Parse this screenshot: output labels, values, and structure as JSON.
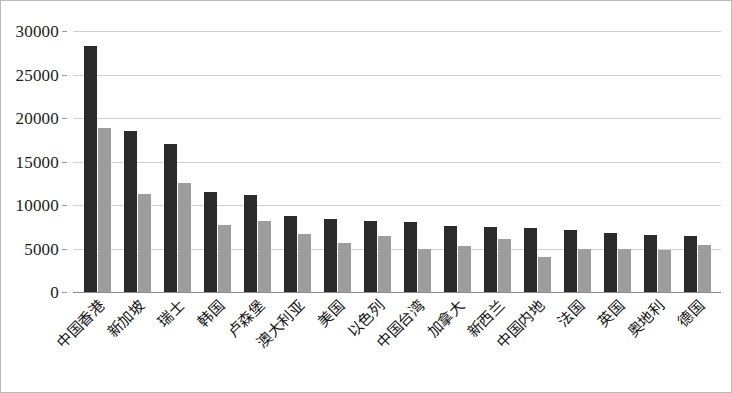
{
  "chart_data": {
    "type": "bar",
    "title": "",
    "subtitle": "",
    "xlabel": "",
    "ylabel": "",
    "ylim": [
      0,
      30000
    ],
    "ytick_interval": 5000,
    "yticks": [
      "0",
      "5000",
      "10000",
      "15000",
      "20000",
      "25000",
      "30000"
    ],
    "ytick_values": [
      0,
      5000,
      10000,
      15000,
      20000,
      25000,
      30000
    ],
    "grid": true,
    "legend": "none",
    "categories": [
      "中国香港",
      "新加坡",
      "瑞士",
      "韩国",
      "卢森堡",
      "澳大利亚",
      "美国",
      "以色列",
      "中国台湾",
      "加拿大",
      "新西兰",
      "中国内地",
      "法国",
      "英国",
      "奥地利",
      "德国"
    ],
    "series": [
      {
        "name": "series-1",
        "color": "#2b2b2b",
        "values": [
          28300,
          18500,
          17000,
          11500,
          11200,
          8700,
          8400,
          8200,
          8050,
          7600,
          7450,
          7400,
          7150,
          6800,
          6500,
          6450
        ]
      },
      {
        "name": "series-2",
        "color": "#9d9d9d",
        "values": [
          18850,
          11300,
          12550,
          7750,
          8150,
          6700,
          5650,
          6400,
          4950,
          5300,
          6100,
          4000,
          4950,
          4950,
          4800,
          5350
        ]
      }
    ]
  },
  "axis": {
    "y_tick_labels": [
      "30000",
      "25000",
      "20000",
      "15000",
      "10000",
      "5000",
      "0"
    ]
  }
}
